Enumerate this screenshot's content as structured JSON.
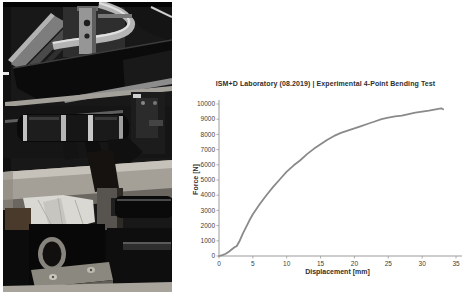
{
  "photo": {
    "subject": "four-point bending test rig with grey pipe specimen",
    "palette": {
      "machine_dark": "#0b0b0b",
      "metal_light": "#b4b4b4",
      "pipe_grey": "#a49f97",
      "paper_white": "#dad8d2"
    }
  },
  "chart_data": {
    "type": "line",
    "title": "ISM+D Laboratory (08.2019) | Experimental 4-Point Bending Test",
    "xlabel": "Displacement [mm]",
    "ylabel": "Force [N]",
    "xlim": [
      0,
      35
    ],
    "ylim": [
      0,
      10000
    ],
    "xticks": [
      0,
      5,
      10,
      15,
      20,
      25,
      30,
      35
    ],
    "yticks": [
      0,
      1000,
      2000,
      3000,
      4000,
      5000,
      6000,
      7000,
      8000,
      9000,
      10000
    ],
    "grid": false,
    "legend": null,
    "colors": {
      "line": "#8a8a8a",
      "axis": "#9b9b9b",
      "tick_text": "#404040"
    },
    "series": [
      {
        "name": "Force-displacement curve",
        "x": [
          0,
          0.5,
          1,
          1.5,
          2,
          2.3,
          2.6,
          3,
          3.5,
          4,
          4.5,
          5,
          6,
          7,
          8,
          9,
          10,
          11,
          12,
          13,
          14,
          15,
          16,
          17,
          18,
          19,
          20,
          21,
          22,
          23,
          24,
          25,
          26,
          27,
          28,
          29,
          30,
          31,
          32,
          32.8,
          33.1
        ],
        "y": [
          0,
          60,
          150,
          300,
          480,
          580,
          640,
          950,
          1450,
          1900,
          2350,
          2750,
          3400,
          4000,
          4550,
          5050,
          5550,
          5950,
          6300,
          6700,
          7050,
          7350,
          7650,
          7900,
          8100,
          8250,
          8400,
          8550,
          8700,
          8850,
          9000,
          9100,
          9180,
          9230,
          9330,
          9430,
          9500,
          9570,
          9650,
          9720,
          9650
        ]
      }
    ]
  }
}
